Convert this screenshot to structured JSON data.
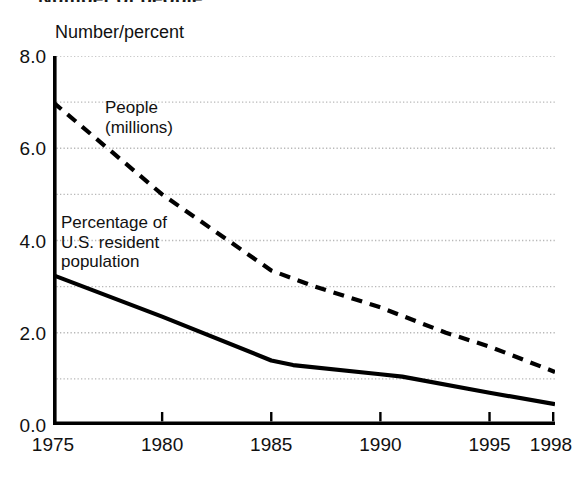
{
  "figure": {
    "title_partial": "Number of people",
    "axis_unit_label": "Number/percent"
  },
  "chart_data": {
    "type": "line",
    "title": "Number of people",
    "xlabel": "",
    "ylabel": "Number/percent",
    "xlim": [
      1975,
      1998
    ],
    "ylim": [
      0.0,
      8.0
    ],
    "grid": true,
    "grid_step": 1.0,
    "legend_position": "inline-annotation",
    "ytick_labels": [
      "8.0",
      "6.0",
      "4.0",
      "2.0",
      "0.0"
    ],
    "ytick_values": [
      8.0,
      6.0,
      4.0,
      2.0,
      0.0
    ],
    "xtick_labels": [
      "1975",
      "1980",
      "1985",
      "1990",
      "1995",
      "1998"
    ],
    "xtick_values": [
      1975,
      1980,
      1985,
      1990,
      1995,
      1998
    ],
    "series": [
      {
        "name": "People (millions)",
        "label": "People\n(millions)",
        "style": "dashed",
        "color": "#000000",
        "x": [
          1975,
          1980,
          1985,
          1987,
          1990,
          1993,
          1995,
          1998
        ],
        "values": [
          7.0,
          5.0,
          3.35,
          3.0,
          2.55,
          2.0,
          1.7,
          1.15
        ]
      },
      {
        "name": "Percentage of U.S. resident population",
        "label": "Percentage of\nU.S. resident\npopulation",
        "style": "solid",
        "color": "#000000",
        "x": [
          1975,
          1980,
          1985,
          1986,
          1990,
          1991,
          1995,
          1998
        ],
        "values": [
          3.25,
          2.35,
          1.4,
          1.3,
          1.1,
          1.05,
          0.7,
          0.45
        ]
      }
    ]
  }
}
